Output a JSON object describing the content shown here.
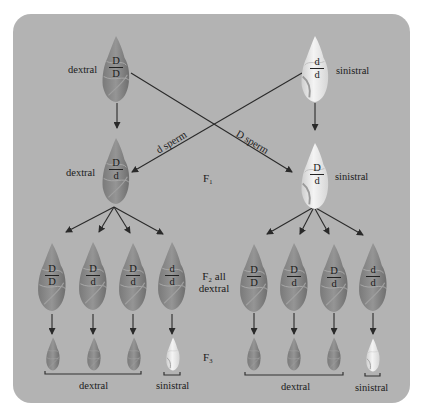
{
  "diagram": {
    "colors": {
      "panel": "#b3b3b3",
      "dextral_shell": "#8c8c8c",
      "sinistral_shell": "#e6e6e6",
      "arrow": "#2a2a2a"
    },
    "parents": {
      "left": {
        "phenotype": "dextral",
        "genotype_top": "D",
        "genotype_bottom": "D"
      },
      "right": {
        "phenotype": "sinistral",
        "genotype_top": "d",
        "genotype_bottom": "d"
      }
    },
    "crosses": {
      "left_label": "d sperm",
      "right_label": "D sperm"
    },
    "f1": {
      "label": "F₁",
      "left": {
        "phenotype": "dextral",
        "genotype_top": "D",
        "genotype_bottom": "d"
      },
      "right": {
        "phenotype": "sinistral",
        "genotype_top": "D",
        "genotype_bottom": "d"
      }
    },
    "f2": {
      "label_line1": "F₂ all",
      "label_line2": "dextral",
      "left": [
        {
          "genotype_top": "D",
          "genotype_bottom": "D"
        },
        {
          "genotype_top": "D",
          "genotype_bottom": "d"
        },
        {
          "genotype_top": "D",
          "genotype_bottom": "d"
        },
        {
          "genotype_top": "d",
          "genotype_bottom": "d"
        }
      ],
      "right": [
        {
          "genotype_top": "D",
          "genotype_bottom": "D"
        },
        {
          "genotype_top": "D",
          "genotype_bottom": "d"
        },
        {
          "genotype_top": "D",
          "genotype_bottom": "d"
        },
        {
          "genotype_top": "d",
          "genotype_bottom": "d"
        }
      ]
    },
    "f3": {
      "label": "F₃",
      "left_group_label": "dextral",
      "left_single_label": "sinistral",
      "right_group_label": "dextral",
      "right_single_label": "sinistral"
    }
  }
}
